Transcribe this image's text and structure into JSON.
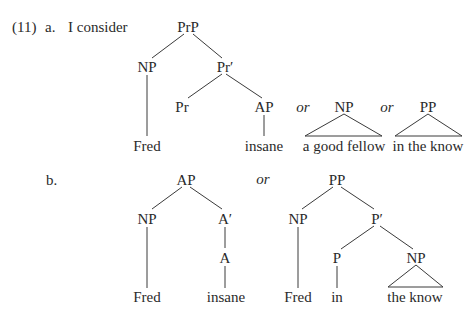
{
  "example_number": "(11)",
  "part_a": {
    "label": "a.",
    "lead_text": "I consider",
    "tree": {
      "root": "PrP",
      "spec": "NP",
      "bar": "Pr′",
      "head": "Pr",
      "complement": "AP",
      "spec_word": "Fred",
      "complement_word": "insane"
    },
    "alternatives": [
      {
        "connector": "or",
        "category": "NP",
        "phrase": "a good fellow"
      },
      {
        "connector": "or",
        "category": "PP",
        "phrase": "in the know"
      }
    ]
  },
  "part_b": {
    "label": "b.",
    "tree_ap": {
      "root": "AP",
      "spec": "NP",
      "bar": "A′",
      "head": "A",
      "spec_word": "Fred",
      "head_word": "insane"
    },
    "connector": "or",
    "tree_pp": {
      "root": "PP",
      "spec": "NP",
      "bar": "P′",
      "head": "P",
      "complement": "NP",
      "spec_word": "Fred",
      "head_word": "in",
      "complement_phrase": "the know"
    }
  }
}
